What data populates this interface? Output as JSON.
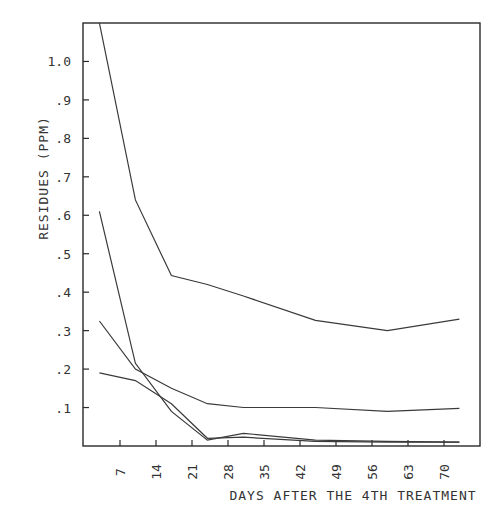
{
  "chart_data": {
    "type": "line",
    "title": "",
    "xlabel": "DAYS AFTER THE 4TH TREATMENT",
    "ylabel": "RESIDUES (PPM)",
    "xlim": [
      0,
      77
    ],
    "ylim": [
      0,
      1.1
    ],
    "grid": false,
    "legend": "none",
    "x_ticks": [
      7,
      14,
      21,
      28,
      35,
      42,
      49,
      56,
      63,
      70
    ],
    "x_tick_labels": [
      "7",
      "14",
      "21",
      "28",
      "35",
      "42",
      "49",
      "56",
      "63",
      "70"
    ],
    "y_ticks": [
      0.1,
      0.2,
      0.3,
      0.4,
      0.5,
      0.6,
      0.7,
      0.8,
      0.9,
      1.0
    ],
    "y_tick_labels": [
      ".1",
      ".2",
      ".3",
      ".4",
      ".5",
      ".6",
      ".7",
      ".8",
      ".9",
      "1.0"
    ],
    "x": [
      3,
      10,
      17,
      24,
      31,
      45,
      59,
      73
    ],
    "series": [
      {
        "name": "series-1",
        "values": [
          1.1,
          0.64,
          0.443,
          0.42,
          0.39,
          0.327,
          0.3,
          0.33
        ]
      },
      {
        "name": "series-2",
        "values": [
          0.61,
          0.215,
          0.09,
          0.015,
          0.033,
          0.015,
          0.012,
          0.01
        ]
      },
      {
        "name": "series-3",
        "values": [
          0.325,
          0.2,
          0.15,
          0.11,
          0.1,
          0.1,
          0.09,
          0.098
        ]
      },
      {
        "name": "series-4",
        "values": [
          0.19,
          0.17,
          0.11,
          0.02,
          0.023,
          0.012,
          0.01,
          0.01
        ]
      }
    ]
  },
  "colors": {
    "line": "#3a3a3a",
    "frame": "#2a2a2a",
    "background": "#ffffff"
  }
}
